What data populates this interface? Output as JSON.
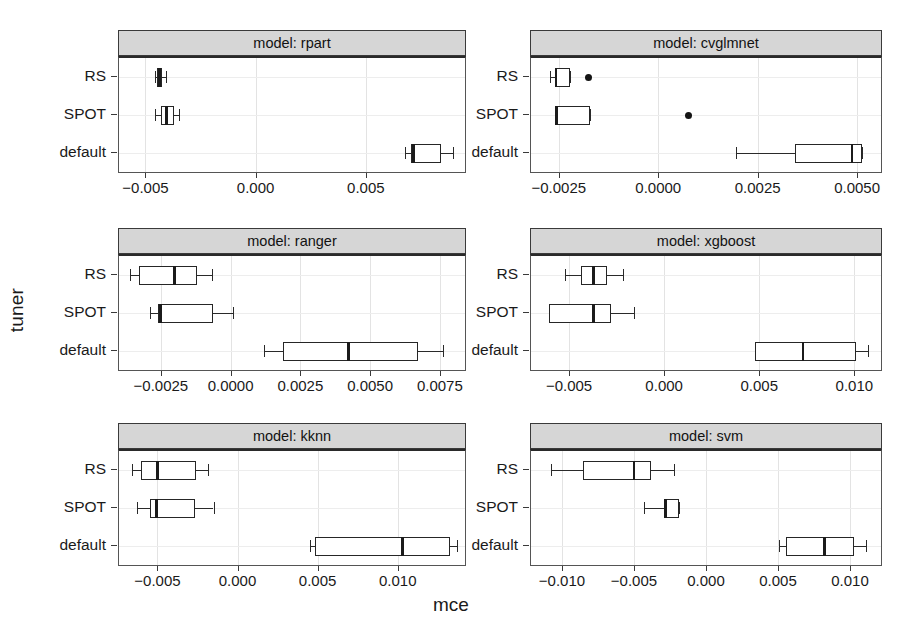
{
  "chart_data": {
    "type": "boxplot",
    "title": "",
    "xlabel": "mce",
    "ylabel": "tuner",
    "grid": true,
    "legend": "none",
    "facet_variable": "model",
    "categories": [
      "RS",
      "SPOT",
      "default"
    ],
    "category_order_top_to_bottom": [
      "RS",
      "SPOT",
      "default"
    ],
    "facets": [
      {
        "strip_label": "model: rpart",
        "model": "rpart",
        "xlim": [
          -0.0062,
          0.0095
        ],
        "xticks": [
          -0.005,
          0.0,
          0.005
        ],
        "xticklabels": [
          "-0.005",
          "0.000",
          "0.005"
        ],
        "boxes": [
          {
            "tuner": "RS",
            "whisker_low": -0.00458,
            "q1": -0.00448,
            "median": -0.00436,
            "q3": -0.00424,
            "whisker_high": -0.00408,
            "outliers": []
          },
          {
            "tuner": "SPOT",
            "whisker_low": -0.00458,
            "q1": -0.0043,
            "median": -0.00404,
            "q3": -0.00372,
            "whisker_high": -0.00348,
            "outliers": []
          },
          {
            "tuner": "default",
            "whisker_low": 0.00676,
            "q1": 0.00703,
            "median": 0.00716,
            "q3": 0.0084,
            "whisker_high": 0.00896,
            "outliers": []
          }
        ]
      },
      {
        "strip_label": "model: cvglmnet",
        "model": "cvglmnet",
        "xlim": [
          -0.0032,
          0.0056
        ],
        "xticks": [
          -0.0025,
          0.0,
          0.0025,
          0.005
        ],
        "xticklabels": [
          "-0.0025",
          "0.0000",
          "0.0025",
          "0.0050"
        ],
        "boxes": [
          {
            "tuner": "RS",
            "whisker_low": -0.00272,
            "q1": -0.00258,
            "median": -0.00257,
            "q3": -0.00222,
            "whisker_high": -0.00222,
            "outliers": [
              -0.00175
            ]
          },
          {
            "tuner": "SPOT",
            "whisker_low": -0.00258,
            "q1": -0.00258,
            "median": -0.00255,
            "q3": -0.00172,
            "whisker_high": -0.00172,
            "outliers": [
              0.00075
            ]
          },
          {
            "tuner": "default",
            "whisker_low": 0.00195,
            "q1": 0.00343,
            "median": 0.00487,
            "q3": 0.00513,
            "whisker_high": 0.00513,
            "outliers": []
          }
        ]
      },
      {
        "strip_label": "model: ranger",
        "model": "ranger",
        "xlim": [
          -0.004,
          0.0084
        ],
        "xticks": [
          -0.0025,
          0.0,
          0.0025,
          0.005,
          0.0075
        ],
        "xticklabels": [
          "-0.0025",
          "0.0000",
          "0.0025",
          "0.0050",
          "0.0075"
        ],
        "boxes": [
          {
            "tuner": "RS",
            "whisker_low": -0.0036,
            "q1": -0.0033,
            "median": -0.002,
            "q3": -0.0012,
            "whisker_high": -0.00065,
            "outliers": []
          },
          {
            "tuner": "SPOT",
            "whisker_low": -0.0029,
            "q1": -0.0026,
            "median": -0.0025,
            "q3": -0.00062,
            "whisker_high": 0.0001,
            "outliers": []
          },
          {
            "tuner": "default",
            "whisker_low": 0.0012,
            "q1": 0.00187,
            "median": 0.00422,
            "q3": 0.0067,
            "whisker_high": 0.0076,
            "outliers": []
          }
        ]
      },
      {
        "strip_label": "model: xgboost",
        "model": "xgboost",
        "xlim": [
          -0.007,
          0.0114
        ],
        "xticks": [
          -0.005,
          0.0,
          0.005,
          0.01
        ],
        "xticklabels": [
          "-0.005",
          "0.000",
          "0.005",
          "0.010"
        ],
        "boxes": [
          {
            "tuner": "RS",
            "whisker_low": -0.0052,
            "q1": -0.00435,
            "median": -0.00372,
            "q3": -0.003,
            "whisker_high": -0.00215,
            "outliers": []
          },
          {
            "tuner": "SPOT",
            "whisker_low": -0.00608,
            "q1": -0.00608,
            "median": -0.0037,
            "q3": -0.00282,
            "whisker_high": -0.0016,
            "outliers": []
          },
          {
            "tuner": "default",
            "whisker_low": 0.00475,
            "q1": 0.00475,
            "median": 0.0073,
            "q3": 0.0101,
            "whisker_high": 0.0107,
            "outliers": []
          }
        ]
      },
      {
        "strip_label": "model: kknn",
        "model": "kknn",
        "xlim": [
          -0.0074,
          0.0142
        ],
        "xticks": [
          -0.005,
          0.0,
          0.005,
          0.01
        ],
        "xticklabels": [
          "-0.005",
          "0.000",
          "0.005",
          "0.010"
        ],
        "boxes": [
          {
            "tuner": "RS",
            "whisker_low": -0.0066,
            "q1": -0.006,
            "median": -0.005,
            "q3": -0.0026,
            "whisker_high": -0.00185,
            "outliers": []
          },
          {
            "tuner": "SPOT",
            "whisker_low": -0.00625,
            "q1": -0.00545,
            "median": -0.00505,
            "q3": -0.00265,
            "whisker_high": -0.0015,
            "outliers": []
          },
          {
            "tuner": "default",
            "whisker_low": 0.00455,
            "q1": 0.00485,
            "median": 0.0103,
            "q3": 0.01325,
            "whisker_high": 0.0137,
            "outliers": []
          }
        ]
      },
      {
        "strip_label": "model: svm",
        "model": "svm",
        "xlim": [
          -0.01215,
          0.01215
        ],
        "xticks": [
          -0.01,
          -0.005,
          0.0,
          0.005,
          0.01
        ],
        "xticklabels": [
          "-0.010",
          "-0.005",
          "0.000",
          "0.005",
          "0.010"
        ],
        "boxes": [
          {
            "tuner": "RS",
            "whisker_low": -0.01075,
            "q1": -0.00855,
            "median": -0.005,
            "q3": -0.00385,
            "whisker_high": -0.00225,
            "outliers": []
          },
          {
            "tuner": "SPOT",
            "whisker_low": -0.0043,
            "q1": -0.0029,
            "median": -0.00282,
            "q3": -0.00185,
            "whisker_high": -0.00185,
            "outliers": []
          },
          {
            "tuner": "default",
            "whisker_low": 0.0051,
            "q1": 0.00555,
            "median": 0.0082,
            "q3": 0.01025,
            "whisker_high": 0.0111,
            "outliers": []
          }
        ]
      }
    ],
    "colors": {
      "box_border": "#262626",
      "box_fill": "#ffffff",
      "median": "#1b1b1b",
      "outlier": "#141414",
      "strip_background": "#d6d6d6",
      "panel_border": "#555555",
      "gridline": "#e3e3e3",
      "background": "#ffffff"
    }
  },
  "layout": {
    "facet_positions": [
      {
        "left": 118,
        "top": 30,
        "width": 348,
        "height": 143
      },
      {
        "left": 530,
        "top": 30,
        "width": 352,
        "height": 143
      },
      {
        "left": 118,
        "top": 228,
        "width": 348,
        "height": 143
      },
      {
        "left": 530,
        "top": 228,
        "width": 352,
        "height": 143
      },
      {
        "left": 118,
        "top": 423,
        "width": 348,
        "height": 143
      },
      {
        "left": 530,
        "top": 423,
        "width": 352,
        "height": 143
      }
    ],
    "strip_height": 26
  }
}
